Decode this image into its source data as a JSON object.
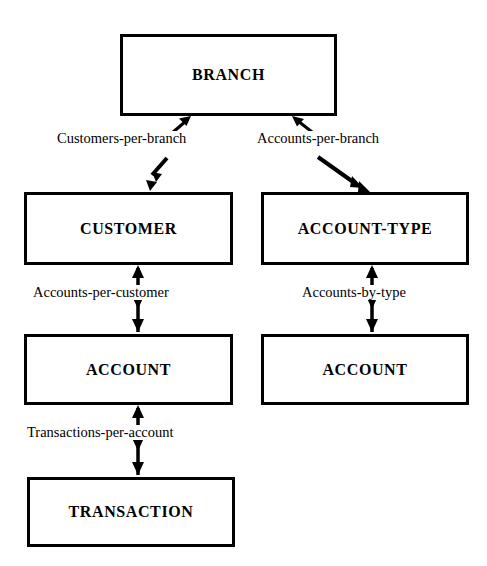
{
  "diagram": {
    "type": "network-data-model-schema",
    "background_color": "#ffffff",
    "line_color": "#000000",
    "entities": [
      {
        "id": "branch",
        "label": "BRANCH",
        "x": 120,
        "y": 34,
        "w": 217,
        "h": 82
      },
      {
        "id": "customer",
        "label": "CUSTOMER",
        "x": 24,
        "y": 192,
        "w": 209,
        "h": 73
      },
      {
        "id": "account_type",
        "label": "ACCOUNT-TYPE",
        "x": 261,
        "y": 192,
        "w": 208,
        "h": 73
      },
      {
        "id": "account_left",
        "label": "ACCOUNT",
        "x": 24,
        "y": 334,
        "w": 209,
        "h": 71
      },
      {
        "id": "account_right",
        "label": "ACCOUNT",
        "x": 261,
        "y": 334,
        "w": 208,
        "h": 71
      },
      {
        "id": "transaction",
        "label": "TRANSACTION",
        "x": 27,
        "y": 477,
        "w": 208,
        "h": 70
      }
    ],
    "set_labels": [
      {
        "id": "customers_per_branch",
        "label": "Customers-per-branch",
        "x": 55,
        "y": 131,
        "from": "branch",
        "to": "customer"
      },
      {
        "id": "accounts_per_branch",
        "label": "Accounts-per-branch",
        "x": 255,
        "y": 131,
        "from": "branch",
        "to": "account_type"
      },
      {
        "id": "accounts_per_customer",
        "label": "Accounts-per-customer",
        "x": 31,
        "y": 285,
        "from": "customer",
        "to": "account_left"
      },
      {
        "id": "accounts_by_type",
        "label": "Accounts-by-type",
        "x": 300,
        "y": 285,
        "from": "account_type",
        "to": "account_right"
      },
      {
        "id": "transactions_per_account",
        "label": "Transactions-per-account",
        "x": 25,
        "y": 425,
        "from": "account_left",
        "to": "transaction"
      }
    ],
    "connectors": [
      {
        "id": "branch-customer",
        "style": "diagonal-double-arrow",
        "orientation": "down-left"
      },
      {
        "id": "branch-account-type",
        "style": "diagonal-double-arrow",
        "orientation": "down-right"
      },
      {
        "id": "customer-account",
        "style": "vertical-double-arrow",
        "orientation": "vertical"
      },
      {
        "id": "account-type-account",
        "style": "vertical-double-arrow",
        "orientation": "vertical"
      },
      {
        "id": "account-transaction",
        "style": "vertical-double-arrow",
        "orientation": "vertical"
      }
    ]
  }
}
